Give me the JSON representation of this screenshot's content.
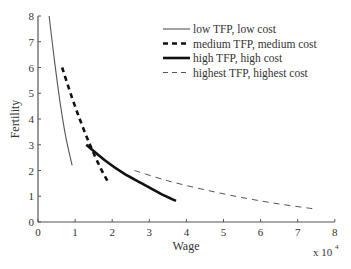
{
  "chart_data": {
    "type": "line",
    "title": "",
    "xlabel": "Wage",
    "ylabel": "Fertility",
    "x_multiplier_label": "x 10",
    "x_multiplier_exp": "4",
    "xlim": [
      0,
      8
    ],
    "ylim": [
      0,
      8
    ],
    "xticks": [
      "0",
      "1",
      "2",
      "3",
      "4",
      "5",
      "6",
      "7",
      "8"
    ],
    "yticks": [
      "0",
      "1",
      "2",
      "3",
      "4",
      "5",
      "6",
      "7",
      "8"
    ],
    "grid": false,
    "legend_position": "upper right",
    "series": [
      {
        "name": "low TFP, low cost",
        "style": "solid-thin",
        "color": "#555555",
        "x": [
          0.3,
          0.45,
          0.6,
          0.75,
          0.92
        ],
        "y": [
          8.0,
          6.2,
          4.6,
          3.3,
          2.2
        ]
      },
      {
        "name": "medium TFP, medium cost",
        "style": "dashed-thick",
        "color": "#111111",
        "x": [
          0.65,
          0.9,
          1.15,
          1.4,
          1.65,
          1.87
        ],
        "y": [
          6.0,
          4.9,
          3.9,
          3.0,
          2.2,
          1.6
        ]
      },
      {
        "name": "high TFP, high cost",
        "style": "solid-thick",
        "color": "#111111",
        "x": [
          1.3,
          1.8,
          2.3,
          2.8,
          3.3,
          3.72
        ],
        "y": [
          3.0,
          2.4,
          1.9,
          1.5,
          1.1,
          0.82
        ]
      },
      {
        "name": "highest TFP, highest cost",
        "style": "dashed-thin",
        "color": "#555555",
        "x": [
          2.6,
          3.5,
          4.5,
          5.5,
          6.5,
          7.5
        ],
        "y": [
          2.0,
          1.6,
          1.25,
          0.95,
          0.7,
          0.5
        ]
      }
    ]
  }
}
